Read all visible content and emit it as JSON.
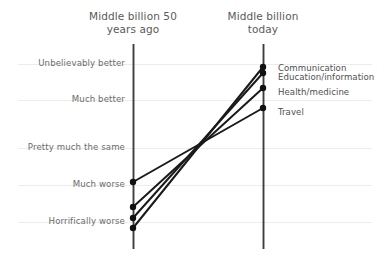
{
  "chart_data": {
    "type": "line",
    "title": "",
    "subtitle": "",
    "xlabel": "",
    "ylabel": "",
    "grid": true,
    "legend_position": "right-inline",
    "columns": [
      {
        "id": "past",
        "label": "Middle billion 50\nyears ago"
      },
      {
        "id": "present",
        "label": "Middle billion\ntoday"
      }
    ],
    "x": [
      "Middle billion 50 years ago",
      "Middle billion today"
    ],
    "categories": [
      "Middle billion 50 years ago",
      "Middle billion today"
    ],
    "y_scale": {
      "ordinal": true,
      "ticks": [
        {
          "label": "Unbelievably better",
          "value": 5
        },
        {
          "label": "Much better",
          "value": 4
        },
        {
          "label": "Pretty much the same",
          "value": 3
        },
        {
          "label": "Much worse",
          "value": 2
        },
        {
          "label": "Horrifically worse",
          "value": 1
        }
      ],
      "ylim": [
        0.6,
        5.4
      ]
    },
    "series": [
      {
        "name": "Communication",
        "values": [
          0.85,
          4.85
        ]
      },
      {
        "name": "Education/information",
        "values": [
          1.11,
          4.7
        ]
      },
      {
        "name": "Health/medicine",
        "values": [
          1.39,
          4.31
        ]
      },
      {
        "name": "Travel",
        "values": [
          2.05,
          3.8
        ]
      }
    ],
    "colors": {
      "line": "#1a1a1a",
      "marker": "#111111",
      "axis": "#3d3d3d",
      "grid": "#ececec",
      "tick_text": "#6b6b6b",
      "series_text": "#4f4f4f",
      "title_text": "#5a5a5a",
      "background": "#ffffff"
    }
  },
  "geometry": {
    "left_axis_x": 133,
    "right_axis_x": 263,
    "axis_top_y": 44,
    "axis_bottom_y": 249,
    "gridline_y": [
      64,
      100,
      148,
      185,
      222
    ],
    "left_point_y": [
      228,
      218,
      207,
      182
    ],
    "right_point_y": [
      67,
      73,
      88,
      108
    ],
    "left_label_y": [
      58,
      94,
      142,
      179,
      216
    ],
    "right_label_y": [
      63,
      72,
      87,
      107
    ]
  }
}
